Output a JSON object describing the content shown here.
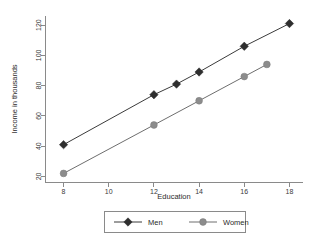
{
  "chart_data": {
    "type": "line",
    "title": "",
    "subtitle": "",
    "xlabel": "Education",
    "ylabel": "Income in thousands",
    "xlim": [
      7.2,
      18.6
    ],
    "ylim": [
      16,
      126
    ],
    "xticks": [
      8,
      10,
      12,
      14,
      16,
      18
    ],
    "yticks": [
      20,
      40,
      60,
      80,
      100,
      120
    ],
    "xtick_labels": [
      "8",
      "10",
      "12",
      "14",
      "16",
      "18"
    ],
    "ytick_labels": [
      "20",
      "40",
      "60",
      "80",
      "100",
      "120"
    ],
    "grid": false,
    "legend_position": "bottom",
    "series": [
      {
        "name": "Men",
        "marker": "diamond",
        "color": "#2e2e2e",
        "x": [
          8,
          12,
          13,
          14,
          16,
          18
        ],
        "values": [
          41,
          74,
          81,
          89,
          106,
          121
        ]
      },
      {
        "name": "Women",
        "marker": "circle",
        "color": "#8c8c8c",
        "x": [
          8,
          12,
          14,
          16,
          17
        ],
        "values": [
          22,
          54,
          70,
          86,
          94
        ]
      }
    ]
  },
  "legend": {
    "items": [
      {
        "label": "Men",
        "marker": "diamond-marker-icon"
      },
      {
        "label": "Women",
        "marker": "circle-marker-icon"
      }
    ]
  },
  "colors": {
    "men": "#2e2e2e",
    "women": "#8c8c8c",
    "axis": "#8a8a8a",
    "background": "#ffffff"
  }
}
